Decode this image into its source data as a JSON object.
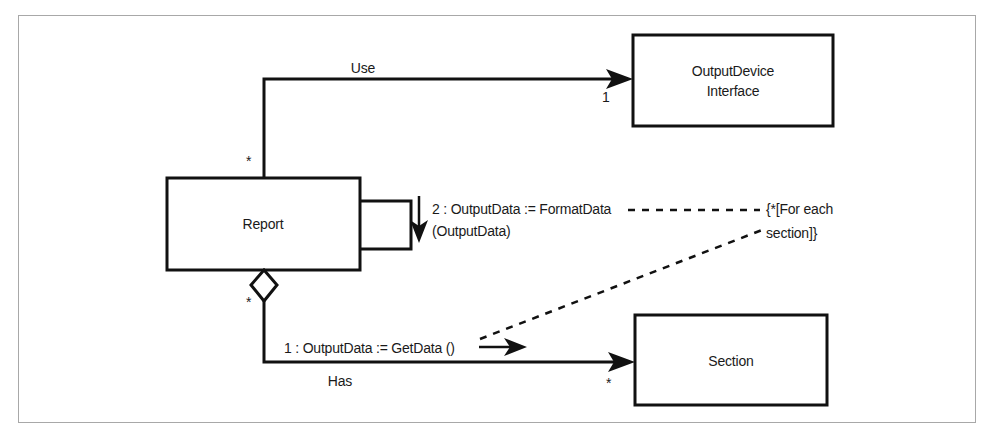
{
  "diagram": {
    "type": "uml-collaboration-diagram",
    "classes": [
      {
        "id": "output_device_interface",
        "name_line1": "OutputDevice",
        "name_line2": "Interface"
      },
      {
        "id": "report",
        "name_line1": "Report",
        "name_line2": ""
      },
      {
        "id": "section",
        "name_line1": "Section",
        "name_line2": ""
      }
    ],
    "associations": [
      {
        "id": "use",
        "label": "Use",
        "source_multiplicity": "*",
        "target_multiplicity": "1"
      },
      {
        "id": "has",
        "label": "Has",
        "source_multiplicity": "*",
        "target_multiplicity": "*"
      }
    ],
    "messages": [
      {
        "id": "msg_format_data",
        "line1": "2 : OutputData := FormatData",
        "line2": "(OutputData)"
      },
      {
        "id": "msg_get_data",
        "line1": "1 : OutputData := GetData ()",
        "line2": ""
      }
    ],
    "notes": [
      {
        "id": "for_each_section",
        "line1": "{*[For each",
        "line2": "section]}"
      }
    ],
    "colors": {
      "stroke": "#111111",
      "frame": "#a8a8a8",
      "background": "#ffffff",
      "text": "#1a1a1a"
    }
  }
}
